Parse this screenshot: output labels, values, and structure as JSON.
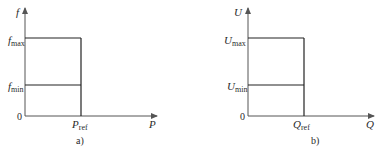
{
  "panels": [
    {
      "id": "a",
      "caption": "a)",
      "y_axis": {
        "label": "f"
      },
      "x_axis": {
        "label": "P"
      },
      "origin_label": "0",
      "y_ticks": [
        {
          "main": "f",
          "sub": "max"
        },
        {
          "main": "f",
          "sub": "min"
        }
      ],
      "x_ticks": [
        {
          "main": "P",
          "sub": "ref"
        }
      ]
    },
    {
      "id": "b",
      "caption": "b)",
      "y_axis": {
        "label": "U"
      },
      "x_axis": {
        "label": "Q"
      },
      "origin_label": "0",
      "y_ticks": [
        {
          "main": "U",
          "sub": "max"
        },
        {
          "main": "U",
          "sub": "min"
        }
      ],
      "x_ticks": [
        {
          "main": "Q",
          "sub": "ref"
        }
      ]
    }
  ],
  "colors": {
    "line": "#222222",
    "axis": "#555555",
    "background": "#ffffff"
  }
}
